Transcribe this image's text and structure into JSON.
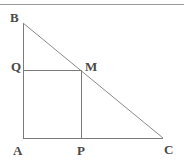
{
  "figure": {
    "kind": "geometry-diagram",
    "canvas": {
      "width": 184,
      "height": 165,
      "background": "#ffffff"
    },
    "top_rule": {
      "present": true,
      "color": "#9a9a9a"
    },
    "stroke": {
      "color": "#7b7b7b",
      "width": 1
    },
    "label_color": "#4a4a4a",
    "points": [
      {
        "name": "B",
        "label": "B",
        "x": 23,
        "y": 23
      },
      {
        "name": "Q",
        "label": "Q",
        "x": 23,
        "y": 70
      },
      {
        "name": "M",
        "label": "M",
        "x": 81,
        "y": 70
      },
      {
        "name": "A",
        "label": "A",
        "x": 23,
        "y": 138
      },
      {
        "name": "P",
        "label": "P",
        "x": 81,
        "y": 138
      },
      {
        "name": "C",
        "label": "C",
        "x": 163,
        "y": 138
      }
    ],
    "segments": [
      {
        "name": "AB",
        "from": "A",
        "to": "B"
      },
      {
        "name": "AC",
        "from": "A",
        "to": "C"
      },
      {
        "name": "BC",
        "from": "B",
        "to": "C"
      },
      {
        "name": "QM",
        "from": "Q",
        "to": "M"
      },
      {
        "name": "PM",
        "from": "P",
        "to": "M"
      }
    ]
  }
}
